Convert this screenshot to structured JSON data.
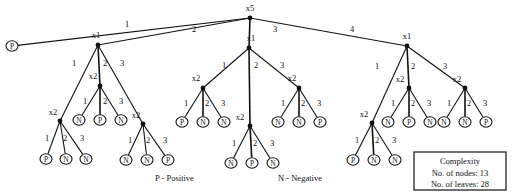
{
  "figure": {
    "type": "decision-tree-diagram",
    "root": {
      "label": "x5",
      "x": 250,
      "y": 18
    }
  },
  "legend": {
    "positive": "P - Positive",
    "negative": "N - Negative",
    "positive_x": 155,
    "positive_y": 181,
    "negative_x": 278,
    "negative_y": 181
  },
  "complexity_box": {
    "title": "Complexity",
    "nodes_line": "No. of nodes: 13",
    "leaves_line": "No. of leaves: 28",
    "x": 414,
    "y": 152,
    "width": 92,
    "height": 38
  },
  "nodes": [
    {
      "id": "root",
      "label": "x5",
      "x": 250,
      "y": 18,
      "lx": 250,
      "ly": 11
    },
    {
      "id": "L_x1",
      "label": "x1",
      "x": 98,
      "y": 45,
      "lx": 96,
      "ly": 38
    },
    {
      "id": "M_x1",
      "label": "x1",
      "x": 249,
      "y": 48,
      "lx": 251,
      "ly": 41
    },
    {
      "id": "R_x1",
      "label": "x1",
      "x": 407,
      "y": 46,
      "lx": 407,
      "ly": 39
    },
    {
      "id": "L_a",
      "label": "x2",
      "x": 60,
      "y": 121,
      "lx": 53,
      "ly": 115
    },
    {
      "id": "L_b",
      "label": "x2",
      "x": 100,
      "y": 86,
      "lx": 93,
      "ly": 79
    },
    {
      "id": "L_c",
      "label": "x2",
      "x": 143,
      "y": 124,
      "lx": 136,
      "ly": 118
    },
    {
      "id": "M_a",
      "label": "x2",
      "x": 203,
      "y": 88,
      "lx": 196,
      "ly": 81
    },
    {
      "id": "M_b",
      "label": "x2",
      "x": 250,
      "y": 126,
      "lx": 240,
      "ly": 120
    },
    {
      "id": "M_c",
      "label": "x2",
      "x": 299,
      "y": 88,
      "lx": 292,
      "ly": 81
    },
    {
      "id": "R_a",
      "label": "x2",
      "x": 372,
      "y": 123,
      "lx": 364,
      "ly": 117
    },
    {
      "id": "R_b",
      "label": "x2",
      "x": 409,
      "y": 88,
      "lx": 400,
      "ly": 82
    },
    {
      "id": "R_c",
      "label": "x2",
      "x": 465,
      "y": 88,
      "lx": 457,
      "ly": 82
    }
  ],
  "leaves": [
    {
      "id": "P0",
      "label": "P",
      "x": 12,
      "y": 46
    },
    {
      "id": "L_a1",
      "label": "P",
      "x": 46,
      "y": 159
    },
    {
      "id": "L_a2",
      "label": "N",
      "x": 66,
      "y": 159
    },
    {
      "id": "L_a3",
      "label": "N",
      "x": 86,
      "y": 159
    },
    {
      "id": "L_b1",
      "label": "N",
      "x": 79,
      "y": 120
    },
    {
      "id": "L_b2",
      "label": "P",
      "x": 100,
      "y": 120
    },
    {
      "id": "L_b3",
      "label": "N",
      "x": 121,
      "y": 120
    },
    {
      "id": "L_c1",
      "label": "N",
      "x": 126,
      "y": 160
    },
    {
      "id": "L_c2",
      "label": "N",
      "x": 147,
      "y": 160
    },
    {
      "id": "L_c3",
      "label": "P",
      "x": 168,
      "y": 160
    },
    {
      "id": "M_a1",
      "label": "P",
      "x": 182,
      "y": 122
    },
    {
      "id": "M_a2",
      "label": "N",
      "x": 203,
      "y": 122
    },
    {
      "id": "M_a3",
      "label": "N",
      "x": 224,
      "y": 122
    },
    {
      "id": "M_b1",
      "label": "N",
      "x": 231,
      "y": 163
    },
    {
      "id": "M_b2",
      "label": "P",
      "x": 252,
      "y": 163
    },
    {
      "id": "M_b3",
      "label": "N",
      "x": 273,
      "y": 163
    },
    {
      "id": "M_c1",
      "label": "N",
      "x": 278,
      "y": 122
    },
    {
      "id": "M_c2",
      "label": "N",
      "x": 299,
      "y": 122
    },
    {
      "id": "M_c3",
      "label": "P",
      "x": 320,
      "y": 122
    },
    {
      "id": "R_a1",
      "label": "P",
      "x": 353,
      "y": 160
    },
    {
      "id": "R_a2",
      "label": "N",
      "x": 374,
      "y": 160
    },
    {
      "id": "R_a3",
      "label": "N",
      "x": 395,
      "y": 160
    },
    {
      "id": "R_b1",
      "label": "N",
      "x": 388,
      "y": 122
    },
    {
      "id": "R_b2",
      "label": "P",
      "x": 409,
      "y": 122
    },
    {
      "id": "R_b3",
      "label": "N",
      "x": 430,
      "y": 122
    },
    {
      "id": "R_c1",
      "label": "N",
      "x": 444,
      "y": 122
    },
    {
      "id": "R_c2",
      "label": "N",
      "x": 465,
      "y": 122
    },
    {
      "id": "R_c3",
      "label": "P",
      "x": 486,
      "y": 122
    }
  ],
  "edges": [
    {
      "from": "root",
      "to": "P0",
      "label": "1",
      "lx": 125,
      "ly": 27
    },
    {
      "from": "root",
      "to": "L_x1",
      "label": "2",
      "lx": 192,
      "ly": 32
    },
    {
      "from": "root",
      "to": "M_x1",
      "label": "3",
      "lx": 273,
      "ly": 32
    },
    {
      "from": "root",
      "to": "R_x1",
      "label": "4",
      "lx": 350,
      "ly": 32
    },
    {
      "from": "L_x1",
      "to": "L_a",
      "label": "1",
      "lx": 72,
      "ly": 66
    },
    {
      "from": "L_x1",
      "to": "L_b",
      "label": "2",
      "lx": 103,
      "ly": 66
    },
    {
      "from": "L_x1",
      "to": "L_c",
      "label": "3",
      "lx": 120,
      "ly": 66
    },
    {
      "from": "L_a",
      "to": "L_a1",
      "label": "1",
      "lx": 45,
      "ly": 141
    },
    {
      "from": "L_a",
      "to": "L_a2",
      "label": "2",
      "lx": 63,
      "ly": 141
    },
    {
      "from": "L_a",
      "to": "L_a3",
      "label": "3",
      "lx": 80,
      "ly": 141
    },
    {
      "from": "L_b",
      "to": "L_b1",
      "label": "1",
      "lx": 83,
      "ly": 104
    },
    {
      "from": "L_b",
      "to": "L_b2",
      "label": "2",
      "lx": 103,
      "ly": 104
    },
    {
      "from": "L_b",
      "to": "L_b3",
      "label": "3",
      "lx": 119,
      "ly": 104
    },
    {
      "from": "L_c",
      "to": "L_c1",
      "label": "1",
      "lx": 128,
      "ly": 143
    },
    {
      "from": "L_c",
      "to": "L_c2",
      "label": "2",
      "lx": 146,
      "ly": 143
    },
    {
      "from": "L_c",
      "to": "L_c3",
      "label": "3",
      "lx": 163,
      "ly": 143
    },
    {
      "from": "M_x1",
      "to": "M_a",
      "label": "1",
      "lx": 222,
      "ly": 68
    },
    {
      "from": "M_x1",
      "to": "M_b",
      "label": "2",
      "lx": 254,
      "ly": 68
    },
    {
      "from": "M_x1",
      "to": "M_c",
      "label": "3",
      "lx": 280,
      "ly": 68
    },
    {
      "from": "M_a",
      "to": "M_a1",
      "label": "1",
      "lx": 184,
      "ly": 106
    },
    {
      "from": "M_a",
      "to": "M_a2",
      "label": "2",
      "lx": 205,
      "ly": 106
    },
    {
      "from": "M_a",
      "to": "M_a3",
      "label": "3",
      "lx": 221,
      "ly": 106
    },
    {
      "from": "M_b",
      "to": "M_b1",
      "label": "1",
      "lx": 232,
      "ly": 146
    },
    {
      "from": "M_b",
      "to": "M_b2",
      "label": "2",
      "lx": 253,
      "ly": 146
    },
    {
      "from": "M_b",
      "to": "M_b3",
      "label": "3",
      "lx": 270,
      "ly": 146
    },
    {
      "from": "M_c",
      "to": "M_c1",
      "label": "1",
      "lx": 281,
      "ly": 106
    },
    {
      "from": "M_c",
      "to": "M_c2",
      "label": "2",
      "lx": 301,
      "ly": 106
    },
    {
      "from": "M_c",
      "to": "M_c3",
      "label": "3",
      "lx": 317,
      "ly": 106
    },
    {
      "from": "R_x1",
      "to": "R_a",
      "label": "1",
      "lx": 375,
      "ly": 69
    },
    {
      "from": "R_x1",
      "to": "R_b",
      "label": "2",
      "lx": 411,
      "ly": 69
    },
    {
      "from": "R_x1",
      "to": "R_c",
      "label": "3",
      "lx": 443,
      "ly": 69
    },
    {
      "from": "R_a",
      "to": "R_a1",
      "label": "1",
      "lx": 355,
      "ly": 143
    },
    {
      "from": "R_a",
      "to": "R_a2",
      "label": "2",
      "lx": 375,
      "ly": 143
    },
    {
      "from": "R_a",
      "to": "R_a3",
      "label": "3",
      "lx": 392,
      "ly": 143
    },
    {
      "from": "R_b",
      "to": "R_b1",
      "label": "1",
      "lx": 391,
      "ly": 106
    },
    {
      "from": "R_b",
      "to": "R_b2",
      "label": "2",
      "lx": 411,
      "ly": 106
    },
    {
      "from": "R_b",
      "to": "R_b3",
      "label": "3",
      "lx": 427,
      "ly": 106
    },
    {
      "from": "R_c",
      "to": "R_c1",
      "label": "1",
      "lx": 447,
      "ly": 106
    },
    {
      "from": "R_c",
      "to": "R_c2",
      "label": "2",
      "lx": 467,
      "ly": 106
    },
    {
      "from": "R_c",
      "to": "R_c3",
      "label": "3",
      "lx": 483,
      "ly": 106
    }
  ],
  "colors": {
    "ink": "#111111",
    "paper": "#ffffff"
  }
}
